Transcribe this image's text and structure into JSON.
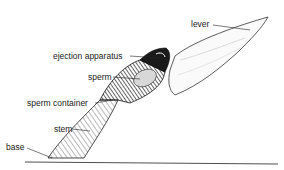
{
  "diagram": {
    "labels": {
      "lever": "lever",
      "ejection_apparatus": "ejection apparatus",
      "sperm": "sperm",
      "sperm_container": "sperm container",
      "stem": "stem",
      "base": "base"
    }
  }
}
